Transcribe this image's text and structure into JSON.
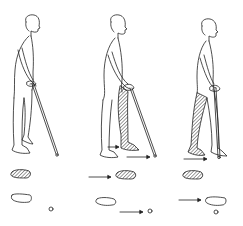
{
  "figure": {
    "type": "illustration",
    "stages": [
      {
        "id": 1,
        "name": "standing-start",
        "cane_moved": false,
        "leg_moved": "none"
      },
      {
        "id": 2,
        "name": "cane-and-affected-leg-forward",
        "cane_moved": true,
        "leg_moved": "affected"
      },
      {
        "id": 3,
        "name": "unaffected-leg-forward",
        "cane_moved": false,
        "leg_moved": "unaffected"
      }
    ],
    "colors": {
      "ink": "#222222",
      "background": "#ffffff"
    }
  }
}
